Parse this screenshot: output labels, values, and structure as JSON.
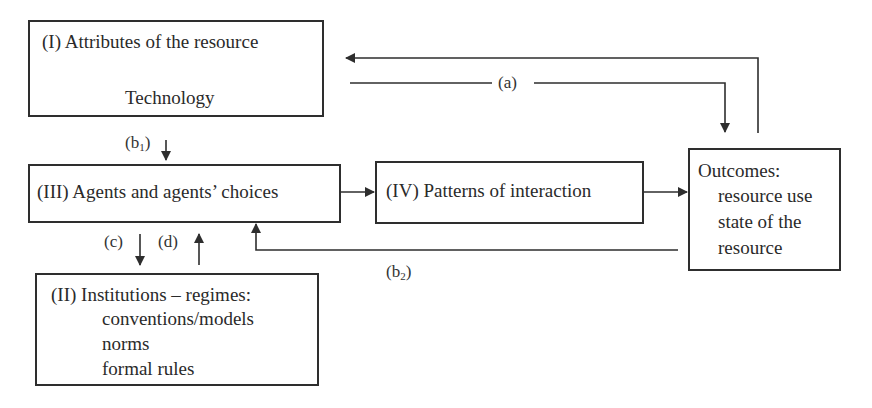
{
  "diagram": {
    "boxes": {
      "attributes": {
        "title": "(I) Attributes of the resource",
        "subtitle": "Technology"
      },
      "agents": {
        "title": "(III) Agents and agents’ choices"
      },
      "patterns": {
        "title": "(IV) Patterns of interaction"
      },
      "outcomes": {
        "title": "Outcomes:",
        "items": [
          "resource use",
          "state of the",
          "resource"
        ]
      },
      "institutions": {
        "title": "(II) Institutions – regimes:",
        "items": [
          "conventions/models",
          "norms",
          "formal rules"
        ]
      }
    },
    "edge_labels": {
      "a": "(a)",
      "b1_base": "(b",
      "b1_sub": "1",
      "b2_base": "(b",
      "b2_sub": "2",
      "close": ")",
      "c": "(c)",
      "d": "(d)"
    },
    "edges": [
      {
        "from": "attributes",
        "to": "outcomes",
        "label": "(a)"
      },
      {
        "from": "outcomes",
        "to": "attributes",
        "label": ""
      },
      {
        "from": "attributes",
        "to": "agents",
        "label": "(b1)"
      },
      {
        "from": "outcomes",
        "to": "agents",
        "label": "(b2)"
      },
      {
        "from": "agents",
        "to": "institutions",
        "label": "(c)"
      },
      {
        "from": "institutions",
        "to": "agents",
        "label": "(d)"
      },
      {
        "from": "agents",
        "to": "patterns",
        "label": ""
      },
      {
        "from": "patterns",
        "to": "outcomes",
        "label": ""
      }
    ],
    "colors": {
      "line": "#2e2e2e",
      "text": "#2a2a2a",
      "background": "#ffffff"
    }
  }
}
